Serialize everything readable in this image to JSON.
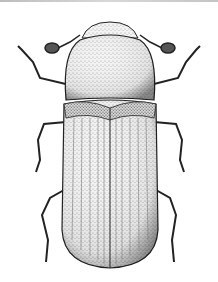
{
  "image": {
    "subject": "beetle",
    "style": "black-and-white stippled scientific illustration",
    "view": "dorsal",
    "background": "#ffffff",
    "ink": "#1a1a1a"
  }
}
